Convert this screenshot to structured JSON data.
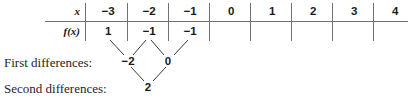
{
  "figure": {
    "kind": "finite-differences-table",
    "row_labels": {
      "x": "x",
      "fx": "f(x)"
    },
    "columns": [
      {
        "x": "−3",
        "fx": "1"
      },
      {
        "x": "−2",
        "fx": "−1"
      },
      {
        "x": "−1",
        "fx": "−1"
      },
      {
        "x": "0",
        "fx": ""
      },
      {
        "x": "1",
        "fx": ""
      },
      {
        "x": "2",
        "fx": ""
      },
      {
        "x": "3",
        "fx": ""
      },
      {
        "x": "4",
        "fx": ""
      }
    ],
    "first_differences": {
      "label": "First differences:",
      "values": [
        "−2",
        "0"
      ]
    },
    "second_differences": {
      "label": "Second differences:",
      "values": [
        "2"
      ]
    },
    "colors": {
      "rule": "#6f6f6f",
      "connector": "#3a3a3a",
      "text": "#1a1a1a",
      "background": "#ffffff"
    }
  }
}
